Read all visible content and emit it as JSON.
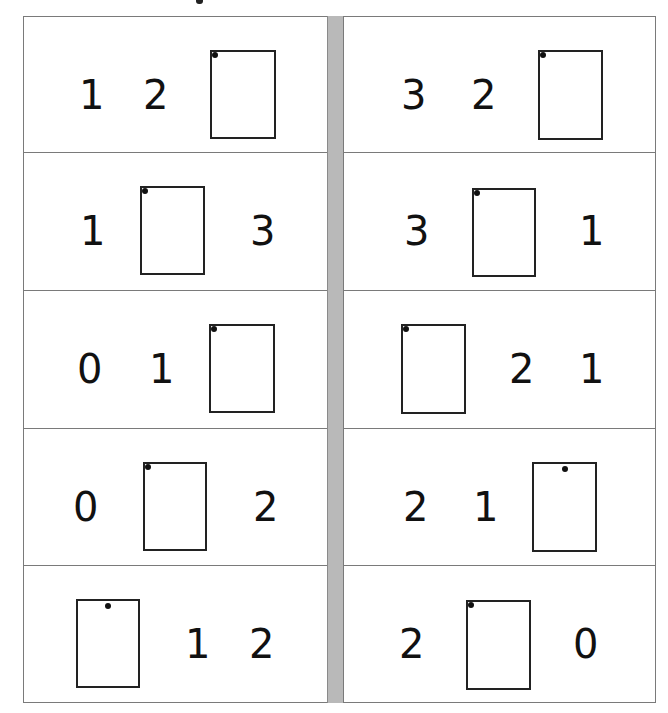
{
  "worksheet": {
    "left_column": [
      {
        "items": [
          {
            "type": "digit",
            "value": "1",
            "x": 55,
            "y": 92
          },
          {
            "type": "digit",
            "value": "2",
            "x": 119,
            "y": 92
          },
          {
            "type": "box",
            "x": 186,
            "y": 33,
            "w": 66,
            "h": 89,
            "dot": "tl"
          }
        ]
      },
      {
        "items": [
          {
            "type": "digit",
            "value": "1",
            "x": 56,
            "y": 92
          },
          {
            "type": "box",
            "x": 116,
            "y": 33,
            "w": 65,
            "h": 89,
            "dot": "tl"
          },
          {
            "type": "digit",
            "value": "3",
            "x": 226,
            "y": 92
          }
        ]
      },
      {
        "items": [
          {
            "type": "digit",
            "value": "0",
            "x": 53,
            "y": 92
          },
          {
            "type": "digit",
            "value": "1",
            "x": 125,
            "y": 92
          },
          {
            "type": "box",
            "x": 185,
            "y": 33,
            "w": 66,
            "h": 89,
            "dot": "tl"
          }
        ]
      },
      {
        "items": [
          {
            "type": "digit",
            "value": "0",
            "x": 49,
            "y": 92
          },
          {
            "type": "box",
            "x": 119,
            "y": 33,
            "w": 64,
            "h": 89,
            "dot": "tl"
          },
          {
            "type": "digit",
            "value": "2",
            "x": 229,
            "y": 92
          }
        ]
      },
      {
        "items": [
          {
            "type": "box",
            "x": 52,
            "y": 33,
            "w": 64,
            "h": 89,
            "dot": "tc"
          },
          {
            "type": "digit",
            "value": "1",
            "x": 161,
            "y": 92
          },
          {
            "type": "digit",
            "value": "2",
            "x": 225,
            "y": 92
          }
        ]
      }
    ],
    "right_column": [
      {
        "items": [
          {
            "type": "digit",
            "value": "3",
            "x": 57,
            "y": 92
          },
          {
            "type": "digit",
            "value": "2",
            "x": 127,
            "y": 92
          },
          {
            "type": "box",
            "x": 194,
            "y": 33,
            "w": 65,
            "h": 90,
            "dot": "tl"
          }
        ]
      },
      {
        "items": [
          {
            "type": "digit",
            "value": "3",
            "x": 60,
            "y": 92
          },
          {
            "type": "box",
            "x": 128,
            "y": 35,
            "w": 64,
            "h": 89,
            "dot": "tl"
          },
          {
            "type": "digit",
            "value": "1",
            "x": 235,
            "y": 92
          }
        ]
      },
      {
        "items": [
          {
            "type": "box",
            "x": 57,
            "y": 33,
            "w": 65,
            "h": 90,
            "dot": "tl"
          },
          {
            "type": "digit",
            "value": "2",
            "x": 165,
            "y": 92
          },
          {
            "type": "digit",
            "value": "1",
            "x": 235,
            "y": 92
          }
        ]
      },
      {
        "items": [
          {
            "type": "digit",
            "value": "2",
            "x": 59,
            "y": 92
          },
          {
            "type": "digit",
            "value": "1",
            "x": 129,
            "y": 92
          },
          {
            "type": "box",
            "x": 188,
            "y": 33,
            "w": 65,
            "h": 90,
            "dot": "tc"
          }
        ]
      },
      {
        "items": [
          {
            "type": "digit",
            "value": "2",
            "x": 55,
            "y": 92
          },
          {
            "type": "box",
            "x": 122,
            "y": 34,
            "w": 65,
            "h": 90,
            "dot": "tl"
          },
          {
            "type": "digit",
            "value": "0",
            "x": 229,
            "y": 92
          }
        ]
      }
    ],
    "row_tops": [
      0,
      136,
      274,
      412,
      549
    ],
    "row_heights": [
      136,
      138,
      138,
      137,
      138
    ],
    "colors": {
      "border": "#7a7a7a",
      "divider": "#b9b9b9",
      "ink": "#111111"
    }
  }
}
